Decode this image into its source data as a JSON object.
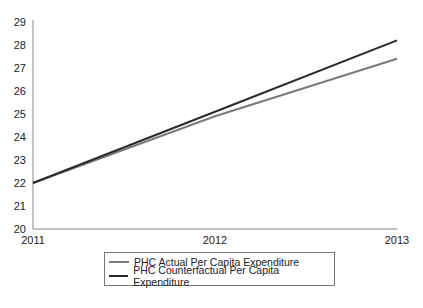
{
  "chart_data": {
    "type": "line",
    "title": "",
    "xlabel": "",
    "ylabel": "",
    "x": [
      "2011",
      "2012",
      "2013"
    ],
    "ylim": [
      20,
      29
    ],
    "yticks": [
      20,
      21,
      22,
      23,
      24,
      25,
      26,
      27,
      28,
      29
    ],
    "grid": false,
    "legend_position": "bottom",
    "series": [
      {
        "name": "PHC Actual Per Capita Expenditure",
        "values": [
          22.0,
          24.9,
          27.4
        ],
        "color": "#7a7a7a"
      },
      {
        "name": "PHC Counterfactual Per Capita Expenditure",
        "values": [
          22.0,
          25.1,
          28.2
        ],
        "color": "#2a2a2a"
      }
    ]
  },
  "legend": {
    "items": [
      {
        "label": "PHC Actual Per Capita Expenditure",
        "color": "#7a7a7a"
      },
      {
        "label": "PHC Counterfactual Per Capita Expenditure",
        "color": "#2a2a2a"
      }
    ]
  }
}
